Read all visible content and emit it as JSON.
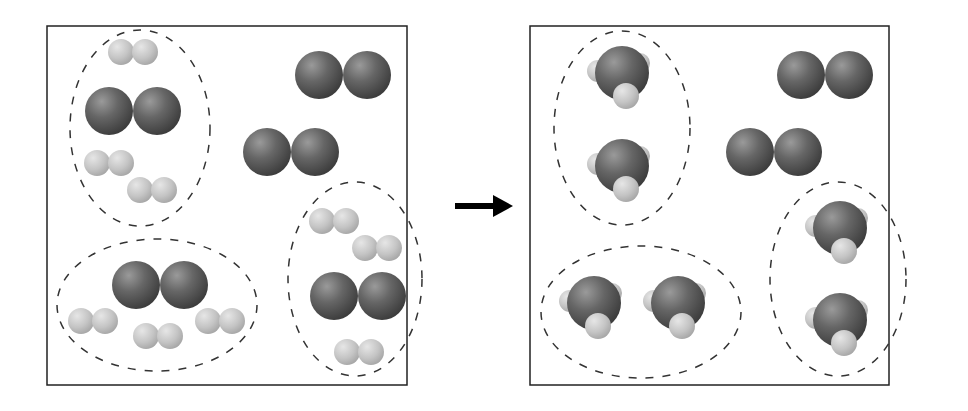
{
  "diagram": {
    "colors": {
      "large_atom": "#555555",
      "small_atom": "#c8c8c8",
      "frame": "#222222",
      "dash": "#333333"
    },
    "left_panel": {
      "label": "reactants",
      "groups": [
        {
          "cx": 140,
          "cy": 128,
          "rx": 70,
          "ry": 98,
          "molecules": [
            {
              "type": "H2",
              "x": 133,
              "y": 52
            },
            {
              "type": "N2",
              "x": 133,
              "y": 111
            },
            {
              "type": "H2",
              "x": 109,
              "y": 163
            },
            {
              "type": "H2",
              "x": 152,
              "y": 190
            }
          ]
        },
        {
          "cx": 157,
          "cy": 305,
          "rx": 100,
          "ry": 66,
          "molecules": [
            {
              "type": "N2",
              "x": 160,
              "y": 285
            },
            {
              "type": "H2",
              "x": 93,
              "y": 321
            },
            {
              "type": "H2",
              "x": 158,
              "y": 336
            },
            {
              "type": "H2",
              "x": 220,
              "y": 321
            }
          ]
        },
        {
          "cx": 355,
          "cy": 279,
          "rx": 67,
          "ry": 97,
          "molecules": [
            {
              "type": "H2",
              "x": 334,
              "y": 221
            },
            {
              "type": "H2",
              "x": 377,
              "y": 248
            },
            {
              "type": "N2",
              "x": 358,
              "y": 296
            },
            {
              "type": "H2",
              "x": 359,
              "y": 352
            }
          ]
        }
      ],
      "free_molecules": [
        {
          "type": "N2",
          "x": 343,
          "y": 75
        },
        {
          "type": "N2",
          "x": 291,
          "y": 152
        }
      ]
    },
    "arrow": {
      "x1": 455,
      "y": 206,
      "x2": 513
    },
    "right_panel": {
      "label": "products",
      "groups": [
        {
          "cx": 622,
          "cy": 128,
          "rx": 68,
          "ry": 97,
          "molecules": [
            {
              "type": "NH3",
              "x": 620,
              "y": 73
            },
            {
              "type": "NH3",
              "x": 620,
              "y": 166
            }
          ]
        },
        {
          "cx": 641,
          "cy": 312,
          "rx": 100,
          "ry": 66,
          "molecules": [
            {
              "type": "NH3",
              "x": 592,
              "y": 303
            },
            {
              "type": "NH3",
              "x": 676,
              "y": 303
            }
          ]
        },
        {
          "cx": 838,
          "cy": 279,
          "rx": 68,
          "ry": 97,
          "molecules": [
            {
              "type": "NH3",
              "x": 838,
              "y": 228
            },
            {
              "type": "NH3",
              "x": 838,
              "y": 320
            }
          ]
        }
      ],
      "free_molecules": [
        {
          "type": "N2",
          "x": 825,
          "y": 75
        },
        {
          "type": "N2",
          "x": 774,
          "y": 152
        }
      ]
    }
  }
}
